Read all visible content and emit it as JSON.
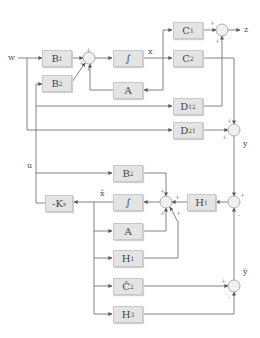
{
  "diagram": {
    "type": "control-system-block-diagram",
    "signals": {
      "w": "w",
      "x": "x",
      "z": "z",
      "y": "y",
      "u": "u",
      "xhat": "x̂",
      "yhat": "ŷ"
    },
    "blocks": {
      "B1": {
        "label": "B",
        "sub": "1"
      },
      "B2_top": {
        "label": "B",
        "sub": "2"
      },
      "int_top": {
        "label": "∫",
        "sub": ""
      },
      "A_top": {
        "label": "A",
        "sub": ""
      },
      "C1": {
        "label": "C",
        "sub": "1"
      },
      "C2": {
        "label": "C",
        "sub": "2"
      },
      "D12": {
        "label": "D",
        "sub": "12"
      },
      "D21": {
        "label": "D",
        "sub": "21"
      },
      "B2_bottom": {
        "label": "B",
        "sub": "2"
      },
      "Ks": {
        "label": "-K",
        "sub": "s"
      },
      "int_bottom": {
        "label": "∫",
        "sub": ""
      },
      "A_bottom": {
        "label": "A",
        "sub": ""
      },
      "H1_right": {
        "label": "H",
        "sub": "1"
      },
      "H1_bottom": {
        "label": "H",
        "sub": "1"
      },
      "C2hat": {
        "label": "Ĉ",
        "sub": "2"
      },
      "H3": {
        "label": "H",
        "sub": "3"
      }
    },
    "junction_signs": {
      "sum_top": [
        "+",
        "+",
        "+"
      ],
      "sum_z": [
        "+",
        "+"
      ],
      "sum_y": [
        "+",
        "+"
      ],
      "sum_mid": [
        "+",
        "+",
        "+",
        "+"
      ],
      "sum_right": [
        "+",
        "-"
      ],
      "sum_yhat": [
        "+",
        "-"
      ]
    },
    "colors": {
      "block_fill": "#e4e4e4",
      "line": "#666666",
      "junction_fill": "#f0f0f0"
    }
  }
}
